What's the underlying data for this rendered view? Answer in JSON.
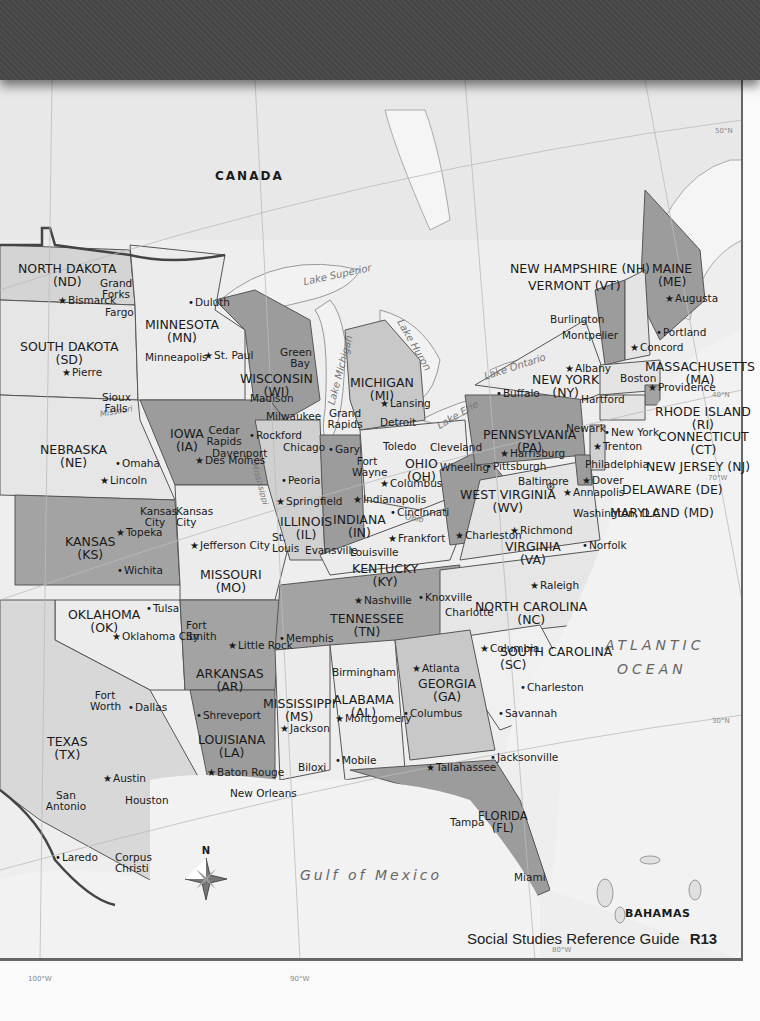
{
  "page": {
    "footer_title": "Social Studies Reference Guide",
    "page_number": "R13"
  },
  "map": {
    "country_labels": {
      "canada": "CANADA",
      "bahamas": "BAHAMAS"
    },
    "water_labels": {
      "lake_superior": "Lake Superior",
      "lake_michigan": "Lake Michigan",
      "lake_huron": "Lake Huron",
      "lake_erie": "Lake Erie",
      "lake_ontario": "Lake Ontario",
      "missouri_river": "Missouri",
      "mississippi_river": "Mississippi",
      "ohio_river": "Ohio",
      "atlantic_ocean_1": "ATLANTIC",
      "atlantic_ocean_2": "OCEAN",
      "gulf_of_mexico": "Gulf of Mexico"
    },
    "coordinates": {
      "lat_50": "50°N",
      "lat_40": "40°N",
      "lat_30": "30°N",
      "lon_70": "70°W",
      "lon_80": "80°W",
      "lon_90": "90°W",
      "lon_100": "100°W"
    },
    "compass_label": "N",
    "states": [
      {
        "name": "NORTH DAKOTA",
        "abbr": "(ND)"
      },
      {
        "name": "SOUTH DAKOTA",
        "abbr": "(SD)"
      },
      {
        "name": "MINNESOTA",
        "abbr": "(MN)"
      },
      {
        "name": "WISCONSIN",
        "abbr": "(WI)"
      },
      {
        "name": "MICHIGAN",
        "abbr": "(MI)"
      },
      {
        "name": "NEBRASKA",
        "abbr": "(NE)"
      },
      {
        "name": "IOWA",
        "abbr": "(IA)"
      },
      {
        "name": "KANSAS",
        "abbr": "(KS)"
      },
      {
        "name": "MISSOURI",
        "abbr": "(MO)"
      },
      {
        "name": "ILLINOIS",
        "abbr": "(IL)"
      },
      {
        "name": "INDIANA",
        "abbr": "(IN)"
      },
      {
        "name": "OHIO",
        "abbr": "(OH)"
      },
      {
        "name": "KENTUCKY",
        "abbr": "(KY)"
      },
      {
        "name": "WEST VIRGINIA",
        "abbr": "(WV)"
      },
      {
        "name": "VIRGINIA",
        "abbr": "(VA)"
      },
      {
        "name": "PENNSYLVANIA",
        "abbr": "(PA)"
      },
      {
        "name": "NEW YORK",
        "abbr": "(NY)"
      },
      {
        "name": "OKLAHOMA",
        "abbr": "(OK)"
      },
      {
        "name": "ARKANSAS",
        "abbr": "(AR)"
      },
      {
        "name": "TENNESSEE",
        "abbr": "(TN)"
      },
      {
        "name": "NORTH CAROLINA",
        "abbr": "(NC)"
      },
      {
        "name": "SOUTH CAROLINA",
        "abbr": "(SC)"
      },
      {
        "name": "TEXAS",
        "abbr": "(TX)"
      },
      {
        "name": "LOUISIANA",
        "abbr": "(LA)"
      },
      {
        "name": "MISSISSIPPI",
        "abbr": "(MS)"
      },
      {
        "name": "ALABAMA",
        "abbr": "(AL)"
      },
      {
        "name": "GEORGIA",
        "abbr": "(GA)"
      },
      {
        "name": "FLORIDA",
        "abbr": "(FL)"
      },
      {
        "name": "MAINE",
        "abbr": "(ME)"
      },
      {
        "name": "MASSACHUSETTS",
        "abbr": "(MA)"
      },
      {
        "name": "RHODE ISLAND",
        "abbr": "(RI)"
      },
      {
        "name": "CONNECTICUT",
        "abbr": "(CT)"
      }
    ],
    "callout_states": {
      "nh": "NEW HAMPSHIRE (NH)",
      "vt": "VERMONT (VT)",
      "nj": "NEW JERSEY (NJ)",
      "de": "DELAWARE (DE)",
      "md": "MARYLAND (MD)"
    },
    "capitals": [
      "Bismarck",
      "Pierre",
      "St. Paul",
      "Madison",
      "Lansing",
      "Lincoln",
      "Des Moines",
      "Topeka",
      "Jefferson City",
      "Springfield",
      "Indianapolis",
      "Columbus",
      "Frankfort",
      "Charleston",
      "Richmond",
      "Harrisburg",
      "Albany",
      "Oklahoma City",
      "Little Rock",
      "Nashville",
      "Raleigh",
      "Columbia",
      "Austin",
      "Baton Rouge",
      "Jackson",
      "Montgomery",
      "Atlanta",
      "Tallahassee",
      "Augusta",
      "Montpelier",
      "Concord",
      "Boston",
      "Providence",
      "Hartford",
      "Trenton",
      "Dover",
      "Annapolis"
    ],
    "national_capital": "Washington, D.C.",
    "cities": [
      "Grand Forks",
      "Fargo",
      "Duluth",
      "Minneapolis",
      "Sioux Falls",
      "Green Bay",
      "Milwaukee",
      "Grand Rapids",
      "Detroit",
      "Omaha",
      "Cedar Rapids",
      "Davenport",
      "Rockford",
      "Chicago",
      "Gary",
      "Fort Wayne",
      "Toledo",
      "Cleveland",
      "Peoria",
      "Kansas City",
      "St. Louis",
      "Evansville",
      "Louisville",
      "Cincinnati",
      "Wheeling",
      "Pittsburgh",
      "Buffalo",
      "Burlington",
      "Portland",
      "Newark",
      "New York",
      "Philadelphia",
      "Baltimore",
      "Norfolk",
      "Wichita",
      "Tulsa",
      "Fort Smith",
      "Memphis",
      "Knoxville",
      "Charlotte",
      "Birmingham",
      "Fort Worth",
      "Dallas",
      "Shreveport",
      "Columbus",
      "Savannah",
      "Charleston",
      "Jacksonville",
      "San Antonio",
      "Houston",
      "Biloxi",
      "Mobile",
      "New Orleans",
      "Laredo",
      "Corpus Christi",
      "Tampa",
      "Miami"
    ]
  }
}
